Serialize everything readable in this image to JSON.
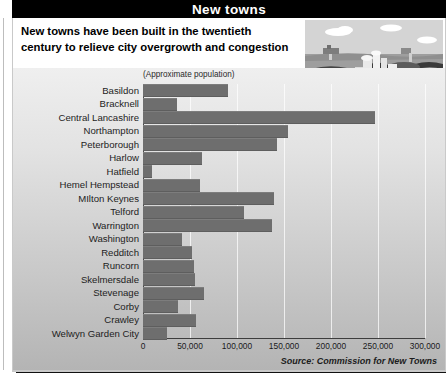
{
  "window": {
    "title": "New towns"
  },
  "header": {
    "subtitle_line1": "New towns have been built in the twentieth",
    "subtitle_line2": "century to relieve city overgrowth and congestion"
  },
  "illustration": {
    "name": "new-town-landscape-illustration",
    "sky_color": "#d2d2d2",
    "ground_color": "#9a9a9a",
    "road_color": "#3a3a3a",
    "building_color": "#e8e8e8"
  },
  "footer": {
    "source": "Source: Commission for New Towns"
  },
  "colors": {
    "title_bar_bg": "#000000",
    "title_bar_text": "#ffffff",
    "bar_fill": "#6e6e6e",
    "panel_bg_top": "#efefef",
    "panel_bg_bottom": "#b4b4b4",
    "gridline": "#ffffff",
    "axis": "#3d3d3d"
  },
  "chart_data": {
    "type": "bar",
    "orientation": "horizontal",
    "title": "New towns",
    "subtitle": "New towns have been built in the twentieth century to relieve city overgrowth and congestion",
    "axis_note": "(Approximate population)",
    "xlabel": "",
    "ylabel": "",
    "xlim": [
      0,
      300000
    ],
    "grid": true,
    "legend": null,
    "source": "Source: Commission for New Towns",
    "tick_values": [
      0,
      50000,
      100000,
      150000,
      200000,
      250000,
      300000
    ],
    "tick_labels": [
      "0",
      "50,000",
      "100,000",
      "150,000",
      "200,000",
      "250,000",
      "300,000"
    ],
    "categories": [
      "Basildon",
      "Bracknell",
      "Central Lancashire",
      "Northampton",
      "Peterborough",
      "Harlow",
      "Hatfield",
      "Hemel Hempstead",
      "MIlton Keynes",
      "Telford",
      "Warrington",
      "Washington",
      "Redditch",
      "Runcorn",
      "Skelmersdale",
      "Stevenage",
      "Corby",
      "Crawley",
      "Welwyn Garden City"
    ],
    "values": [
      90000,
      36000,
      247000,
      154000,
      143000,
      63000,
      10000,
      61000,
      139000,
      107000,
      137000,
      42000,
      52000,
      54000,
      55000,
      65000,
      37000,
      56000,
      26000
    ]
  }
}
